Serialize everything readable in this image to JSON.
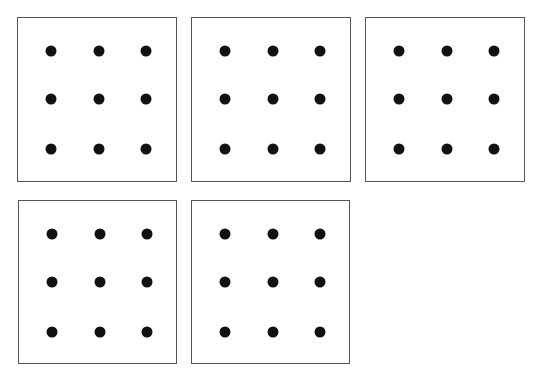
{
  "caption": "",
  "grids": [
    {
      "id": 1,
      "x": 17,
      "y": 17,
      "w": 160,
      "h": 165,
      "rows": 3,
      "cols": 3
    },
    {
      "id": 2,
      "x": 191,
      "y": 17,
      "w": 160,
      "h": 165,
      "rows": 3,
      "cols": 3
    },
    {
      "id": 3,
      "x": 365,
      "y": 17,
      "w": 160,
      "h": 165,
      "rows": 3,
      "cols": 3
    },
    {
      "id": 4,
      "x": 18,
      "y": 200,
      "w": 159,
      "h": 164,
      "rows": 3,
      "cols": 3
    },
    {
      "id": 5,
      "x": 191,
      "y": 200,
      "w": 159,
      "h": 164,
      "rows": 3,
      "cols": 3
    }
  ],
  "dot_offsets": {
    "x": [
      33,
      81,
      128
    ],
    "y": [
      33,
      81,
      131
    ]
  },
  "colors": {
    "dot": "#111111",
    "border": "#555555"
  }
}
